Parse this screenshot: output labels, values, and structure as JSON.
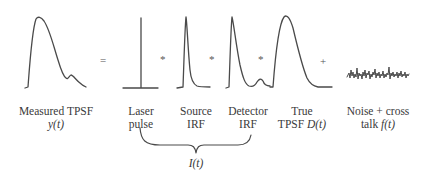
{
  "operators": {
    "equals": "=",
    "conv1": "*",
    "conv2": "*",
    "conv3": "*",
    "plus": "+"
  },
  "labels": {
    "measured": {
      "line1": "Measured TPSF",
      "line2": "y(t)"
    },
    "laser": {
      "line1": "Laser",
      "line2": "pulse"
    },
    "source": {
      "line1": "Source",
      "line2": "IRF"
    },
    "detector": {
      "line1": "Detector",
      "line2": "IRF"
    },
    "true_tpsf": {
      "line1": "True",
      "line2_text": "TPSF ",
      "line2_math": "D(t)"
    },
    "noise": {
      "line1": "Noise + cross",
      "line2_text": "talk ",
      "line2_math": "f(t)"
    },
    "brace": "I(t)"
  },
  "colors": {
    "stroke": "#4a4a4a",
    "text": "#3a3a3a"
  }
}
